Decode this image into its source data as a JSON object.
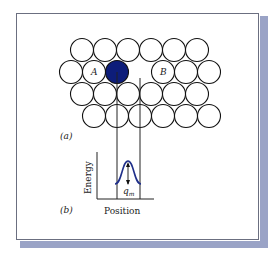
{
  "figure": {
    "panel_a_label": "(a)",
    "panel_b_label": "(b)",
    "atom_labels": {
      "left": "A",
      "right": "B"
    },
    "lattice": {
      "rows": [
        {
          "atoms": [
            "empty",
            "empty",
            "empty",
            "empty",
            "empty",
            "empty"
          ]
        },
        {
          "atoms": [
            "empty",
            "A",
            "moving",
            "vacancy",
            "B",
            "empty",
            "empty"
          ]
        },
        {
          "atoms": [
            "empty",
            "empty",
            "empty",
            "empty",
            "empty",
            "empty"
          ]
        },
        {
          "atoms": [
            "empty",
            "empty",
            "empty",
            "empty",
            "empty",
            "empty"
          ]
        }
      ]
    },
    "energy_plot": {
      "ylabel": "Energy",
      "xlabel": "Position",
      "barrier_label": "q",
      "barrier_subscript": "m"
    },
    "colors": {
      "moving_atom": "#0d1d7a",
      "curve": "#1f2f8a",
      "outline": "#111111",
      "frame_shadow": "#9aa3c6"
    }
  }
}
